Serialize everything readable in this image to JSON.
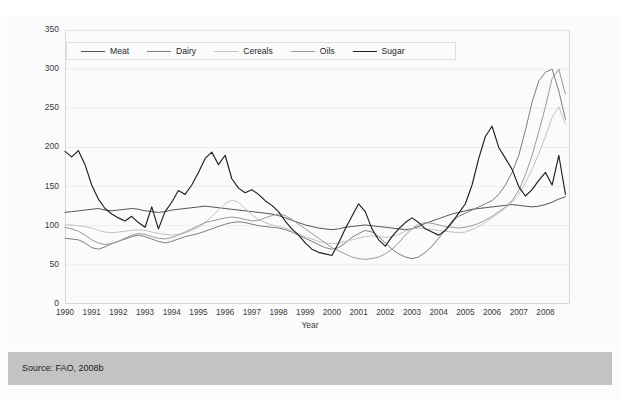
{
  "source": {
    "text": "Source: FAO, 2008b"
  },
  "chart_data": {
    "type": "line",
    "title": "",
    "subtitle": "",
    "xlabel": "Year",
    "ylabel": "",
    "grid": true,
    "legend_position": "top-left-inside",
    "xlim": [
      1990,
      2008.92
    ],
    "ylim": [
      0,
      350
    ],
    "yticks": [
      0,
      50,
      100,
      150,
      200,
      250,
      300,
      350
    ],
    "xticks": [
      1990,
      1991,
      1992,
      1993,
      1994,
      1995,
      1996,
      1997,
      1998,
      1999,
      2000,
      2001,
      2002,
      2003,
      2004,
      2005,
      2006,
      2007,
      2008
    ],
    "annotations": [],
    "colors": {
      "meat": "#545454",
      "dairy": "#7d7d7d",
      "cereals": "#c2c2c2",
      "oils": "#9a9a9a",
      "sugar": "#1f1f1f"
    },
    "series": [
      {
        "name": "Meat",
        "color": "#545454",
        "x": [
          1990.0,
          1990.25,
          1990.5,
          1990.75,
          1991.0,
          1991.25,
          1991.5,
          1991.75,
          1992.0,
          1992.25,
          1992.5,
          1992.75,
          1993.0,
          1993.25,
          1993.5,
          1993.75,
          1994.0,
          1994.25,
          1994.5,
          1994.75,
          1995.0,
          1995.25,
          1995.5,
          1995.75,
          1996.0,
          1996.25,
          1996.5,
          1996.75,
          1997.0,
          1997.25,
          1997.5,
          1997.75,
          1998.0,
          1998.25,
          1998.5,
          1998.75,
          1999.0,
          1999.25,
          1999.5,
          1999.75,
          2000.0,
          2000.25,
          2000.5,
          2000.75,
          2001.0,
          2001.25,
          2001.5,
          2001.75,
          2002.0,
          2002.25,
          2002.5,
          2002.75,
          2003.0,
          2003.25,
          2003.5,
          2003.75,
          2004.0,
          2004.25,
          2004.5,
          2004.75,
          2005.0,
          2005.25,
          2005.5,
          2005.75,
          2006.0,
          2006.25,
          2006.5,
          2006.75,
          2007.0,
          2007.25,
          2007.5,
          2007.75,
          2008.0,
          2008.25,
          2008.5,
          2008.75
        ],
        "values": [
          117,
          118,
          119,
          120,
          121,
          122,
          120,
          119,
          120,
          121,
          122,
          121,
          119,
          118,
          117,
          118,
          120,
          121,
          122,
          123,
          124,
          125,
          124,
          123,
          122,
          121,
          120,
          119,
          118,
          117,
          116,
          115,
          113,
          110,
          107,
          104,
          101,
          99,
          97,
          96,
          95,
          96,
          98,
          99,
          100,
          101,
          100,
          99,
          98,
          97,
          96,
          95,
          96,
          99,
          103,
          106,
          109,
          112,
          115,
          117,
          119,
          121,
          122,
          123,
          124,
          125,
          126,
          127,
          126,
          125,
          124,
          125,
          127,
          130,
          134,
          137
        ]
      },
      {
        "name": "Dairy",
        "color": "#7d7d7d",
        "x": [
          1990.0,
          1990.25,
          1990.5,
          1990.75,
          1991.0,
          1991.25,
          1991.5,
          1991.75,
          1992.0,
          1992.25,
          1992.5,
          1992.75,
          1993.0,
          1993.25,
          1993.5,
          1993.75,
          1994.0,
          1994.25,
          1994.5,
          1994.75,
          1995.0,
          1995.25,
          1995.5,
          1995.75,
          1996.0,
          1996.25,
          1996.5,
          1996.75,
          1997.0,
          1997.25,
          1997.5,
          1997.75,
          1998.0,
          1998.25,
          1998.5,
          1998.75,
          1999.0,
          1999.25,
          1999.5,
          1999.75,
          2000.0,
          2000.25,
          2000.5,
          2000.75,
          2001.0,
          2001.25,
          2001.5,
          2001.75,
          2002.0,
          2002.25,
          2002.5,
          2002.75,
          2003.0,
          2003.25,
          2003.5,
          2003.75,
          2004.0,
          2004.25,
          2004.5,
          2004.75,
          2005.0,
          2005.25,
          2005.5,
          2005.75,
          2006.0,
          2006.25,
          2006.5,
          2006.75,
          2007.0,
          2007.25,
          2007.5,
          2007.75,
          2008.0,
          2008.25,
          2008.5,
          2008.75
        ],
        "values": [
          84,
          83,
          82,
          78,
          72,
          70,
          73,
          77,
          80,
          83,
          86,
          88,
          86,
          83,
          80,
          78,
          80,
          83,
          86,
          88,
          90,
          93,
          96,
          99,
          102,
          104,
          105,
          104,
          102,
          100,
          99,
          98,
          97,
          95,
          92,
          88,
          84,
          80,
          76,
          72,
          70,
          72,
          78,
          85,
          90,
          94,
          92,
          86,
          78,
          70,
          64,
          60,
          58,
          60,
          66,
          74,
          84,
          95,
          106,
          112,
          116,
          120,
          124,
          128,
          132,
          140,
          152,
          168,
          190,
          222,
          258,
          285,
          296,
          300,
          272,
          236
        ]
      },
      {
        "name": "Cereals",
        "color": "#c2c2c2",
        "x": [
          1990.0,
          1990.25,
          1990.5,
          1990.75,
          1991.0,
          1991.25,
          1991.5,
          1991.75,
          1992.0,
          1992.25,
          1992.5,
          1992.75,
          1993.0,
          1993.25,
          1993.5,
          1993.75,
          1994.0,
          1994.25,
          1994.5,
          1994.75,
          1995.0,
          1995.25,
          1995.5,
          1995.75,
          1996.0,
          1996.25,
          1996.5,
          1996.75,
          1997.0,
          1997.25,
          1997.5,
          1997.75,
          1998.0,
          1998.25,
          1998.5,
          1998.75,
          1999.0,
          1999.25,
          1999.5,
          1999.75,
          2000.0,
          2000.25,
          2000.5,
          2000.75,
          2001.0,
          2001.25,
          2001.5,
          2001.75,
          2002.0,
          2002.25,
          2002.5,
          2002.75,
          2003.0,
          2003.25,
          2003.5,
          2003.75,
          2004.0,
          2004.25,
          2004.5,
          2004.75,
          2005.0,
          2005.25,
          2005.5,
          2005.75,
          2006.0,
          2006.25,
          2006.5,
          2006.75,
          2007.0,
          2007.25,
          2007.5,
          2007.75,
          2008.0,
          2008.25,
          2008.5,
          2008.75
        ],
        "values": [
          101,
          101,
          100,
          99,
          97,
          94,
          92,
          91,
          92,
          93,
          94,
          95,
          94,
          92,
          90,
          89,
          88,
          89,
          91,
          94,
          98,
          104,
          112,
          120,
          128,
          133,
          130,
          122,
          114,
          108,
          104,
          101,
          99,
          97,
          94,
          90,
          86,
          83,
          80,
          78,
          77,
          78,
          80,
          82,
          84,
          86,
          87,
          86,
          85,
          86,
          89,
          93,
          96,
          97,
          96,
          95,
          94,
          93,
          92,
          91,
          92,
          95,
          99,
          104,
          110,
          116,
          122,
          130,
          140,
          155,
          172,
          192,
          214,
          238,
          252,
          230
        ]
      },
      {
        "name": "Oils",
        "color": "#9a9a9a",
        "x": [
          1990.0,
          1990.25,
          1990.5,
          1990.75,
          1991.0,
          1991.25,
          1991.5,
          1991.75,
          1992.0,
          1992.25,
          1992.5,
          1992.75,
          1993.0,
          1993.25,
          1993.5,
          1993.75,
          1994.0,
          1994.25,
          1994.5,
          1994.75,
          1995.0,
          1995.25,
          1995.5,
          1995.75,
          1996.0,
          1996.25,
          1996.5,
          1996.75,
          1997.0,
          1997.25,
          1997.5,
          1997.75,
          1998.0,
          1998.25,
          1998.5,
          1998.75,
          1999.0,
          1999.25,
          1999.5,
          1999.75,
          2000.0,
          2000.25,
          2000.5,
          2000.75,
          2001.0,
          2001.25,
          2001.5,
          2001.75,
          2002.0,
          2002.25,
          2002.5,
          2002.75,
          2003.0,
          2003.25,
          2003.5,
          2003.75,
          2004.0,
          2004.25,
          2004.5,
          2004.75,
          2005.0,
          2005.25,
          2005.5,
          2005.75,
          2006.0,
          2006.25,
          2006.5,
          2006.75,
          2007.0,
          2007.25,
          2007.5,
          2007.75,
          2008.0,
          2008.25,
          2008.5,
          2008.75
        ],
        "values": [
          98,
          96,
          93,
          88,
          82,
          78,
          76,
          77,
          80,
          84,
          88,
          90,
          89,
          86,
          84,
          83,
          85,
          88,
          92,
          96,
          100,
          104,
          106,
          108,
          110,
          111,
          110,
          108,
          106,
          107,
          110,
          113,
          115,
          113,
          108,
          102,
          96,
          90,
          84,
          78,
          72,
          68,
          64,
          60,
          58,
          57,
          58,
          60,
          64,
          70,
          78,
          88,
          96,
          102,
          104,
          103,
          101,
          99,
          98,
          97,
          98,
          100,
          103,
          107,
          112,
          118,
          124,
          132,
          145,
          165,
          190,
          220,
          252,
          288,
          300,
          268
        ]
      },
      {
        "name": "Sugar",
        "color": "#1f1f1f",
        "x": [
          1990.0,
          1990.25,
          1990.5,
          1990.75,
          1991.0,
          1991.25,
          1991.5,
          1991.75,
          1992.0,
          1992.25,
          1992.5,
          1992.75,
          1993.0,
          1993.25,
          1993.5,
          1993.75,
          1994.0,
          1994.25,
          1994.5,
          1994.75,
          1995.0,
          1995.25,
          1995.5,
          1995.75,
          1996.0,
          1996.25,
          1996.5,
          1996.75,
          1997.0,
          1997.25,
          1997.5,
          1997.75,
          1998.0,
          1998.25,
          1998.5,
          1998.75,
          1999.0,
          1999.25,
          1999.5,
          1999.75,
          2000.0,
          2000.25,
          2000.5,
          2000.75,
          2001.0,
          2001.25,
          2001.5,
          2001.75,
          2002.0,
          2002.25,
          2002.5,
          2002.75,
          2003.0,
          2003.25,
          2003.5,
          2003.75,
          2004.0,
          2004.25,
          2004.5,
          2004.75,
          2005.0,
          2005.25,
          2005.5,
          2005.75,
          2006.0,
          2006.25,
          2006.5,
          2006.75,
          2007.0,
          2007.25,
          2007.5,
          2007.75,
          2008.0,
          2008.25,
          2008.5,
          2008.75
        ],
        "values": [
          195,
          188,
          196,
          178,
          152,
          134,
          122,
          115,
          110,
          106,
          112,
          104,
          98,
          124,
          96,
          118,
          130,
          145,
          140,
          152,
          168,
          186,
          194,
          178,
          190,
          160,
          148,
          142,
          146,
          140,
          132,
          126,
          118,
          106,
          96,
          88,
          78,
          70,
          66,
          64,
          62,
          78,
          96,
          112,
          128,
          118,
          96,
          82,
          74,
          86,
          96,
          104,
          110,
          104,
          96,
          92,
          88,
          94,
          104,
          116,
          128,
          152,
          186,
          214,
          227,
          200,
          186,
          172,
          150,
          138,
          146,
          158,
          168,
          152,
          190,
          140
        ]
      }
    ]
  },
  "legend": {
    "items": [
      {
        "label": "Meat",
        "color": "#545454"
      },
      {
        "label": "Dairy",
        "color": "#7d7d7d"
      },
      {
        "label": "Cereals",
        "color": "#c2c2c2"
      },
      {
        "label": "Oils",
        "color": "#9a9a9a"
      },
      {
        "label": "Sugar",
        "color": "#1f1f1f"
      }
    ]
  }
}
